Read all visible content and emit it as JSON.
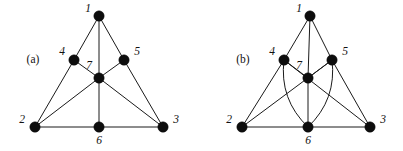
{
  "figure": {
    "background_color": "#ffffff",
    "ink_color": "#111111",
    "vertex_color": "#0d0d0d",
    "vertex_radius": 5.2,
    "panels": [
      {
        "id": "panel-a",
        "caption": "(a)",
        "caption_x": 33,
        "caption_y": 60,
        "vertices": [
          {
            "id": "v1",
            "label": "1",
            "x": 99,
            "y": 16,
            "label_x": 88,
            "label_y": 9
          },
          {
            "id": "v2",
            "label": "2",
            "x": 35,
            "y": 127,
            "label_x": 22,
            "label_y": 120
          },
          {
            "id": "v3",
            "label": "3",
            "x": 163,
            "y": 127,
            "label_x": 176,
            "label_y": 120
          },
          {
            "id": "v4",
            "label": "4",
            "x": 74,
            "y": 60,
            "label_x": 62,
            "label_y": 52
          },
          {
            "id": "v5",
            "label": "5",
            "x": 124,
            "y": 60,
            "label_x": 137,
            "label_y": 52
          },
          {
            "id": "v6",
            "label": "6",
            "x": 99,
            "y": 127,
            "label_x": 99,
            "label_y": 141
          },
          {
            "id": "v7",
            "label": "7",
            "x": 99,
            "y": 78,
            "label_x": 89,
            "label_y": 66
          }
        ],
        "edges": [
          {
            "from": "v1",
            "to": "v4",
            "type": "line"
          },
          {
            "from": "v1",
            "to": "v5",
            "type": "line"
          },
          {
            "from": "v1",
            "to": "v7",
            "type": "line"
          },
          {
            "from": "v4",
            "to": "v2",
            "type": "line"
          },
          {
            "from": "v4",
            "to": "v7",
            "type": "line"
          },
          {
            "from": "v5",
            "to": "v3",
            "type": "line"
          },
          {
            "from": "v5",
            "to": "v7",
            "type": "line"
          },
          {
            "from": "v2",
            "to": "v6",
            "type": "line"
          },
          {
            "from": "v6",
            "to": "v3",
            "type": "line"
          },
          {
            "from": "v2",
            "to": "v7",
            "type": "line"
          },
          {
            "from": "v3",
            "to": "v7",
            "type": "line"
          },
          {
            "from": "v7",
            "to": "v6",
            "type": "line"
          }
        ]
      },
      {
        "id": "panel-b",
        "caption": "(b)",
        "caption_x": 243,
        "caption_y": 60,
        "vertices": [
          {
            "id": "v1",
            "label": "1",
            "x": 310,
            "y": 16,
            "label_x": 299,
            "label_y": 9
          },
          {
            "id": "v2",
            "label": "2",
            "x": 242,
            "y": 127,
            "label_x": 229,
            "label_y": 120
          },
          {
            "id": "v3",
            "label": "3",
            "x": 370,
            "y": 127,
            "label_x": 383,
            "label_y": 120
          },
          {
            "id": "v4",
            "label": "4",
            "x": 284,
            "y": 60,
            "label_x": 272,
            "label_y": 52
          },
          {
            "id": "v5",
            "label": "5",
            "x": 332,
            "y": 60,
            "label_x": 345,
            "label_y": 52
          },
          {
            "id": "v6",
            "label": "6",
            "x": 308,
            "y": 127,
            "label_x": 308,
            "label_y": 141
          },
          {
            "id": "v7",
            "label": "7",
            "x": 308,
            "y": 78,
            "label_x": 299,
            "label_y": 66
          }
        ],
        "edges": [
          {
            "from": "v1",
            "to": "v4",
            "type": "line"
          },
          {
            "from": "v1",
            "to": "v5",
            "type": "line"
          },
          {
            "from": "v1",
            "to": "v7",
            "type": "line"
          },
          {
            "from": "v4",
            "to": "v2",
            "type": "line"
          },
          {
            "from": "v4",
            "to": "v7",
            "type": "line"
          },
          {
            "from": "v5",
            "to": "v3",
            "type": "line"
          },
          {
            "from": "v5",
            "to": "v7",
            "type": "line"
          },
          {
            "from": "v2",
            "to": "v6",
            "type": "line"
          },
          {
            "from": "v6",
            "to": "v3",
            "type": "line"
          },
          {
            "from": "v2",
            "to": "v5",
            "type": "line"
          },
          {
            "from": "v3",
            "to": "v4",
            "type": "line"
          },
          {
            "from": "v7",
            "to": "v6",
            "type": "line"
          },
          {
            "from": "v4",
            "to": "v6",
            "type": "curve",
            "bulge": 18
          },
          {
            "from": "v5",
            "to": "v6",
            "type": "curve",
            "bulge": -18
          }
        ]
      }
    ]
  }
}
